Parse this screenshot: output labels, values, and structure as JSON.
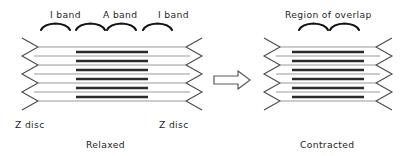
{
  "figure": {
    "panels": [
      {
        "id": "relaxed",
        "caption": "Relaxed",
        "band_labels": [
          {
            "id": "i-band-left",
            "text": "I band"
          },
          {
            "id": "a-band",
            "text": "A band"
          },
          {
            "id": "i-band-right",
            "text": "I band"
          }
        ],
        "z_disc_labels": [
          {
            "id": "z-disc-left",
            "text": "Z disc"
          },
          {
            "id": "z-disc-right",
            "text": "Z disc"
          }
        ],
        "thin_filament_rows": 5,
        "thick_filament_rows": 4,
        "sarcomere_length_px": 180,
        "a_band_length_px": 72,
        "i_band_length_px": 54
      },
      {
        "id": "contracted",
        "caption": "Contracted",
        "band_labels": [
          {
            "id": "region-of-overlap",
            "text": "Region of overlap"
          }
        ],
        "z_disc_labels": [],
        "thin_filament_rows": 5,
        "thick_filament_rows": 4,
        "sarcomere_length_px": 128,
        "a_band_length_px": 72,
        "i_band_length_px": 28
      }
    ],
    "transition": {
      "id": "contraction-arrow",
      "icon": "right-arrow-icon",
      "direction": "right"
    }
  },
  "colors": {
    "thin_filament": "#9a9a9a",
    "thick_filament": "#2b2b2b",
    "z_disc": "#4a4a4a",
    "bracket": "#141414",
    "text": "#1f1f1f",
    "background": "#ffffff"
  }
}
